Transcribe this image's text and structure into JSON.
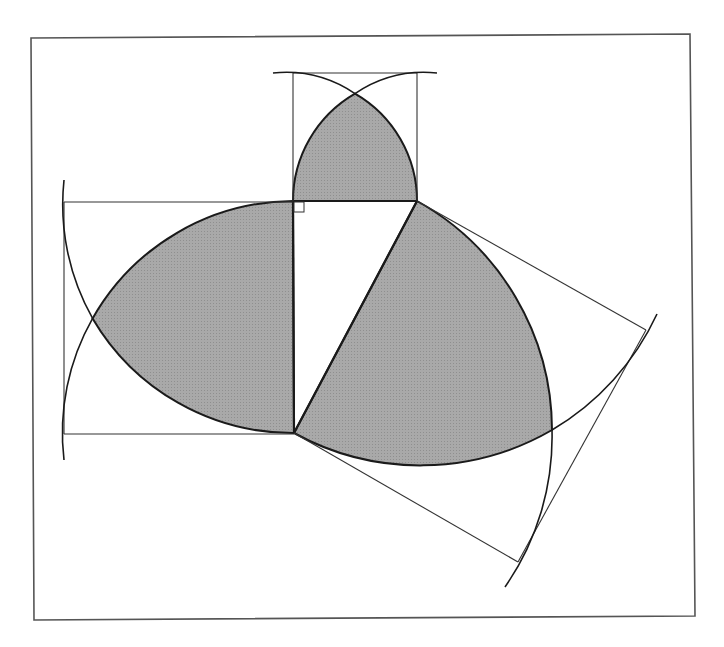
{
  "diagram": {
    "title": "",
    "colors": {
      "background": "#ffffff",
      "stroke": "#1a1a1a",
      "thin_stroke": "#333333",
      "shade": "#a6a6a6",
      "frame": "#555555"
    },
    "frame": {
      "x1": 31,
      "y1": 37,
      "x2": 692,
      "y2": 618
    },
    "triangle": {
      "right_angle_vertex": [
        293,
        201
      ],
      "vertex_b": [
        417,
        201
      ],
      "vertex_c": [
        294,
        433
      ],
      "right_angle_marker": true
    },
    "squares": [
      {
        "name": "top-square",
        "side": "AB",
        "corners": [
          [
            293,
            201
          ],
          [
            417,
            201
          ],
          [
            417,
            77
          ],
          [
            293,
            77
          ]
        ]
      },
      {
        "name": "left-square",
        "side": "AC",
        "corners": [
          [
            293,
            201
          ],
          [
            294,
            433
          ],
          [
            64,
            434
          ],
          [
            64,
            202
          ]
        ]
      },
      {
        "name": "hypotenuse-square",
        "side": "BC",
        "corners": [
          [
            417,
            201
          ],
          [
            294,
            433
          ],
          [
            522,
            560
          ],
          [
            647,
            328
          ]
        ]
      }
    ],
    "shaded_regions": [
      {
        "name": "top-lens"
      },
      {
        "name": "left-lens"
      },
      {
        "name": "hypotenuse-lens"
      }
    ]
  }
}
